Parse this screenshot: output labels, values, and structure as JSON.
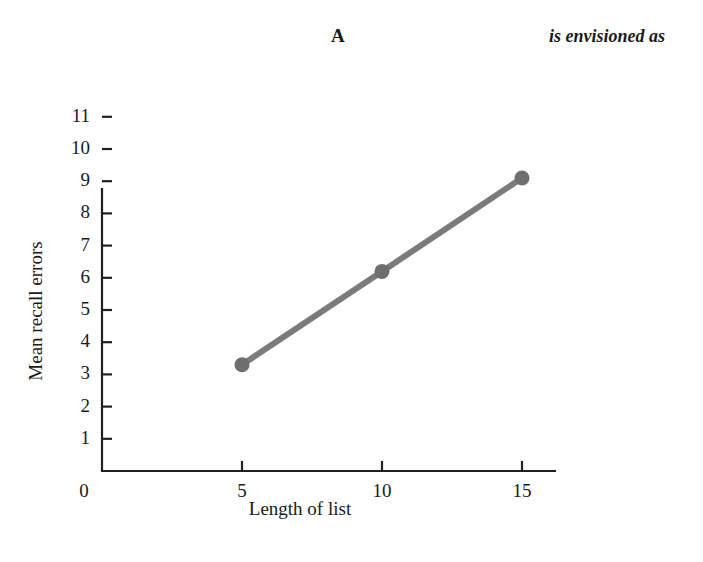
{
  "header": {
    "panel_letter": "A",
    "running_text": "is envisioned as"
  },
  "chart_data": {
    "type": "line",
    "title": "",
    "subtitle": "",
    "xlabel": "Length of list",
    "ylabel": "Mean recall errors",
    "x": [
      5,
      10,
      15
    ],
    "values": [
      3.3,
      6.2,
      9.1
    ],
    "series": [
      {
        "name": "Mean recall errors",
        "x": [
          5,
          10,
          15
        ],
        "values": [
          3.3,
          6.2,
          9.1
        ]
      }
    ],
    "xlim": [
      0,
      16
    ],
    "ylim": [
      0,
      11.5
    ],
    "xticks": [
      0,
      5,
      10,
      15
    ],
    "xtick_labels": [
      "0",
      "5",
      "10",
      "15"
    ],
    "yticks": [
      1,
      2,
      3,
      4,
      5,
      6,
      7,
      8,
      9,
      10,
      11
    ],
    "ytick_labels": [
      "1",
      "2",
      "3",
      "4",
      "5",
      "6",
      "7",
      "8",
      "9",
      "10",
      "11"
    ],
    "y_origin_label": "0",
    "grid": false,
    "legend": false,
    "legend_position": "none",
    "line_color": "#7b7b7b",
    "marker_color": "#6e6e6e",
    "marker_shape": "circle",
    "axis_color": "#231f20",
    "annotations": []
  }
}
